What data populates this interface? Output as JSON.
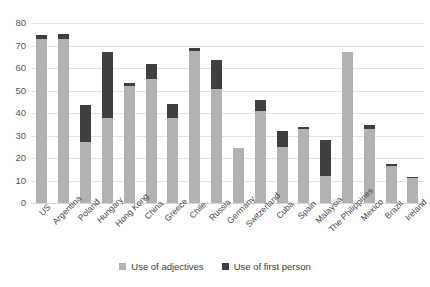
{
  "chart_data": {
    "type": "bar",
    "stacked": true,
    "title": "",
    "xlabel": "",
    "ylabel": "",
    "ylim": [
      0,
      80
    ],
    "ytick_step": 10,
    "yticks": [
      0,
      10,
      20,
      30,
      40,
      50,
      60,
      70,
      80
    ],
    "grid": true,
    "legend_position": "bottom",
    "categories": [
      "US",
      "Argentina",
      "Poland",
      "Hungary",
      "Hong Kong",
      "China",
      "Greece",
      "Chile",
      "Russia",
      "Germany",
      "Switzerland",
      "Cuba",
      "Spain",
      "Malaysia",
      "The Philippines",
      "Mexico",
      "Brazil",
      "Ireland"
    ],
    "series": [
      {
        "name": "Use of adjectives",
        "color": "#b2b2b2",
        "values": [
          73,
          73,
          27,
          38,
          52,
          55,
          38,
          67.5,
          50.5,
          24.5,
          41,
          25,
          33,
          12,
          67,
          33,
          16.5,
          11
        ]
      },
      {
        "name": "Use of first person",
        "color": "#3f3f3f",
        "values": [
          1.5,
          2,
          16.5,
          29,
          1.5,
          7,
          6,
          1.5,
          13,
          0,
          5,
          7,
          1,
          16,
          0,
          1.5,
          1,
          0.5
        ]
      }
    ],
    "totals": [
      74.5,
      75,
      43.5,
      67,
      53.5,
      62,
      44,
      69,
      63.5,
      24.5,
      46,
      32,
      34,
      28,
      67,
      34.5,
      17.5,
      11.5
    ]
  },
  "legend": {
    "items": [
      {
        "label": "Use of adjectives",
        "swatch": "light-gray-swatch"
      },
      {
        "label": "Use of first person",
        "swatch": "dark-gray-swatch"
      }
    ]
  },
  "colors": {
    "adjectives": "#b2b2b2",
    "first_person": "#3f3f3f",
    "gridline": "#e4e4e4",
    "axis_text": "#585858",
    "background": "#ffffff"
  }
}
